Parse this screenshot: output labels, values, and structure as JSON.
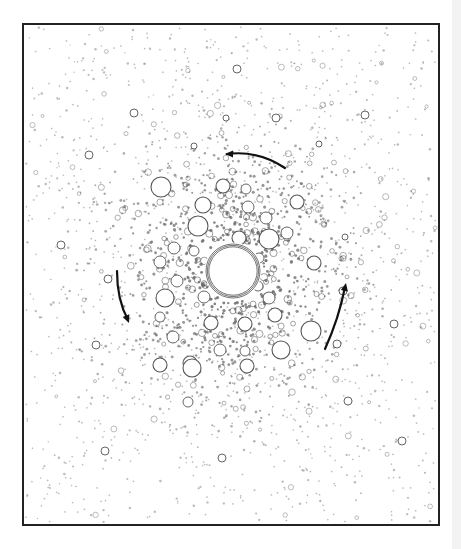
{
  "figure": {
    "frame": {
      "x": 23,
      "y": 24,
      "width": 416,
      "height": 501,
      "stroke": "#222222",
      "stroke_width": 2
    },
    "colors": {
      "ink": "#333333",
      "dot": "#6a6a6a",
      "circle": "#555555",
      "arrow": "#111111",
      "background": "#ffffff"
    },
    "center": {
      "x": 233,
      "y": 271,
      "radius": 27,
      "rings": 3
    },
    "large_circles": [
      {
        "x": 161,
        "y": 187,
        "r": 10
      },
      {
        "x": 203,
        "y": 205,
        "r": 8
      },
      {
        "x": 223,
        "y": 186,
        "r": 7
      },
      {
        "x": 246,
        "y": 189,
        "r": 5
      },
      {
        "x": 297,
        "y": 202,
        "r": 7
      },
      {
        "x": 248,
        "y": 207,
        "r": 6
      },
      {
        "x": 269,
        "y": 239,
        "r": 10
      },
      {
        "x": 198,
        "y": 226,
        "r": 10
      },
      {
        "x": 174,
        "y": 248,
        "r": 6
      },
      {
        "x": 239,
        "y": 238,
        "r": 7
      },
      {
        "x": 287,
        "y": 233,
        "r": 6
      },
      {
        "x": 314,
        "y": 263,
        "r": 7
      },
      {
        "x": 266,
        "y": 218,
        "r": 6
      },
      {
        "x": 160,
        "y": 262,
        "r": 6
      },
      {
        "x": 194,
        "y": 251,
        "r": 5
      },
      {
        "x": 165,
        "y": 298,
        "r": 9
      },
      {
        "x": 204,
        "y": 297,
        "r": 6
      },
      {
        "x": 275,
        "y": 315,
        "r": 7
      },
      {
        "x": 269,
        "y": 298,
        "r": 6
      },
      {
        "x": 245,
        "y": 324,
        "r": 7
      },
      {
        "x": 211,
        "y": 323,
        "r": 7
      },
      {
        "x": 311,
        "y": 331,
        "r": 10
      },
      {
        "x": 220,
        "y": 350,
        "r": 6
      },
      {
        "x": 281,
        "y": 350,
        "r": 9
      },
      {
        "x": 173,
        "y": 337,
        "r": 6
      },
      {
        "x": 190,
        "y": 363,
        "r": 7
      },
      {
        "x": 245,
        "y": 351,
        "r": 5
      },
      {
        "x": 160,
        "y": 365,
        "r": 7
      },
      {
        "x": 192,
        "y": 368,
        "r": 9
      },
      {
        "x": 247,
        "y": 366,
        "r": 7
      },
      {
        "x": 188,
        "y": 402,
        "r": 5
      },
      {
        "x": 160,
        "y": 317,
        "r": 5
      },
      {
        "x": 177,
        "y": 281,
        "r": 6
      },
      {
        "x": 214,
        "y": 266,
        "r": 5
      },
      {
        "x": 259,
        "y": 258,
        "r": 5
      },
      {
        "x": 258,
        "y": 286,
        "r": 5
      },
      {
        "x": 237,
        "y": 69,
        "r": 4
      },
      {
        "x": 134,
        "y": 113,
        "r": 4
      },
      {
        "x": 226,
        "y": 118,
        "r": 3
      },
      {
        "x": 276,
        "y": 118,
        "r": 4
      },
      {
        "x": 365,
        "y": 115,
        "r": 4
      },
      {
        "x": 89,
        "y": 155,
        "r": 4
      },
      {
        "x": 61,
        "y": 245,
        "r": 4
      },
      {
        "x": 108,
        "y": 279,
        "r": 4
      },
      {
        "x": 96,
        "y": 345,
        "r": 4
      },
      {
        "x": 105,
        "y": 451,
        "r": 4
      },
      {
        "x": 402,
        "y": 441,
        "r": 4
      },
      {
        "x": 222,
        "y": 458,
        "r": 4
      },
      {
        "x": 394,
        "y": 324,
        "r": 4
      },
      {
        "x": 345,
        "y": 237,
        "r": 3
      },
      {
        "x": 343,
        "y": 291,
        "r": 4
      },
      {
        "x": 337,
        "y": 344,
        "r": 4
      },
      {
        "x": 348,
        "y": 401,
        "r": 4
      },
      {
        "x": 194,
        "y": 146,
        "r": 3
      },
      {
        "x": 319,
        "y": 144,
        "r": 3
      }
    ],
    "dots": {
      "seed": 1337,
      "count": 2400,
      "center_x": 233,
      "center_y": 271,
      "core_sigma": 78,
      "halo_fraction": 0.5,
      "ring_fraction": 0.12
    },
    "arrows": [
      {
        "name": "arrow-top",
        "path": "M285,168 Q258,150 227,154",
        "head": {
          "x": 225,
          "y": 154,
          "angle": 180
        }
      },
      {
        "name": "arrow-left",
        "path": "M117,271 Q117,300 128,320",
        "head": {
          "x": 129,
          "y": 323,
          "angle": 68
        }
      },
      {
        "name": "arrow-right",
        "path": "M325,349 Q339,318 345,287",
        "head": {
          "x": 346,
          "y": 283,
          "angle": -78
        }
      }
    ]
  }
}
